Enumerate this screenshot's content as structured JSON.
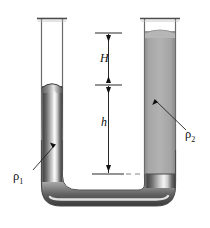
{
  "figure": {
    "type": "physics-diagram",
    "background_color": "#ffffff",
    "canvas": {
      "width": 210,
      "height": 228
    }
  },
  "labels": {
    "height_H": "H",
    "height_h": "h",
    "density_1": "ρ",
    "density_1_sub": "1",
    "density_2": "ρ",
    "density_2_sub": "2"
  },
  "colors": {
    "fluid_light": "#a9a9a9",
    "fluid_dark_edge": "#3a3a3a",
    "fluid_highlight": "#f2f2f2",
    "glass_outline": "#5a5a5a",
    "line": "#111111",
    "dashed_line": "#777777"
  },
  "geometry": {
    "left_tube": {
      "x_left": 41,
      "x_right": 63,
      "top_y": 18,
      "fluid_surface_y": 85
    },
    "right_tube": {
      "x_left": 144,
      "x_right": 176,
      "top_y": 18,
      "fluid_surface_y": 31,
      "interface_y": 174
    },
    "dimension_line_x": 108,
    "H_top_y": 33,
    "H_bottom_y": 85,
    "h_top_y": 85,
    "h_bottom_y": 174,
    "reference_line_y": 174
  },
  "annotations": [
    {
      "name": "dimension-H",
      "label": "H",
      "from_y": 33,
      "to_y": 85,
      "style": "double-arrow"
    },
    {
      "name": "dimension-h",
      "label": "h",
      "from_y": 85,
      "to_y": 174,
      "style": "double-arrow"
    },
    {
      "name": "leader-rho1",
      "label": "ρ1",
      "points_to": "left-tube-fluid"
    },
    {
      "name": "leader-rho2",
      "label": "ρ2",
      "points_to": "right-tube-fluid"
    }
  ]
}
